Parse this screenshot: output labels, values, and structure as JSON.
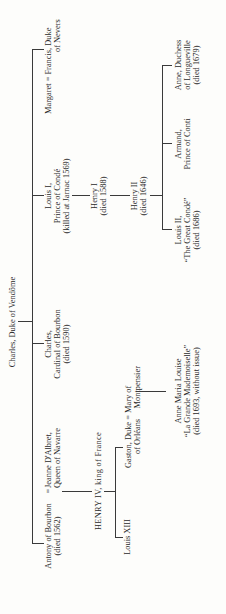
{
  "root": {
    "name": "Charles, Duke of Vendôme"
  },
  "children": [
    {
      "line1": "Antony of Bourbon",
      "line2": "(died 1562)"
    },
    {
      "line1": "Jeanne D'Albret,",
      "line2": "Queen of Navarre",
      "marriage": "="
    },
    {
      "line1": "Charles,",
      "line2": "Cardinal of Bourbon",
      "line3": "(died 1590)"
    },
    {
      "line1": "Louis I,",
      "line2": "Prince of Condé",
      "line3": "(killed at Jarnac 1569)"
    },
    {
      "line1": "Margaret = Francis, Duke",
      "line2": "of Nevers"
    }
  ],
  "henry_iv": "HENRY IV, king of France",
  "henry_iv_children": [
    {
      "line1": "Louis XIII"
    },
    {
      "line1": "Gaston, Duke = Mary of",
      "line2": "of Orléans     Montpensier"
    }
  ],
  "anne_marie": {
    "line1": "Anne Maria Louise",
    "line2": "“La Grande Mademoiselle”",
    "line3": "(died 1693, without issue)"
  },
  "henry_i": {
    "line1": "Henry I",
    "line2": "(died 1588)"
  },
  "henry_ii": {
    "line1": "Henry II",
    "line2": "(died 1646)"
  },
  "henry_ii_children": [
    {
      "line1": "Louis II,",
      "line2": "“The Great Condé”",
      "line3": "(died 1686)"
    },
    {
      "line1": "Armand,",
      "line2": "Prince of Conti"
    },
    {
      "line1": "Anne, Duchess",
      "line2": "of Longueville",
      "line3": "(died 1679)"
    }
  ]
}
